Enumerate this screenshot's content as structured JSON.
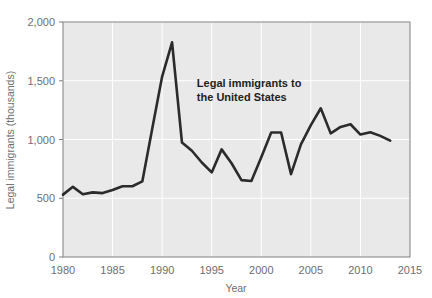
{
  "chart_data": {
    "type": "line",
    "title": "",
    "xlabel": "Year",
    "ylabel": "Legal immigrants (thousands)",
    "xlim": [
      1980,
      2015
    ],
    "ylim": [
      0,
      2000
    ],
    "grid": true,
    "legend": "none",
    "annotation": {
      "line1": "Legal immigrants to",
      "line2": "the United States",
      "x": 1993.5,
      "y": 1450
    },
    "xticks": [
      1980,
      1985,
      1990,
      1995,
      2000,
      2005,
      2010,
      2015
    ],
    "xtick_labels": [
      "1980",
      "1985",
      "1990",
      "1995",
      "2000",
      "2005",
      "2010",
      "2015"
    ],
    "yticks": [
      0,
      500,
      1000,
      1500,
      2000
    ],
    "ytick_labels": [
      "0",
      "500",
      "1,000",
      "1,500",
      "2,000"
    ],
    "series": [
      {
        "name": "Legal immigrants to the United States",
        "color": "#2b2b2b",
        "x": [
          1980,
          1981,
          1982,
          1983,
          1984,
          1985,
          1986,
          1987,
          1988,
          1989,
          1990,
          1991,
          1992,
          1993,
          1994,
          1995,
          1996,
          1997,
          1998,
          1999,
          2000,
          2001,
          2002,
          2003,
          2004,
          2005,
          2006,
          2007,
          2008,
          2009,
          2010,
          2011,
          2012,
          2013
        ],
        "values": [
          531,
          597,
          534,
          550,
          544,
          570,
          602,
          602,
          643,
          1091,
          1536,
          1827,
          974,
          904,
          804,
          720,
          916,
          798,
          654,
          647,
          850,
          1059,
          1060,
          705,
          958,
          1122,
          1266,
          1052,
          1107,
          1130,
          1042,
          1062,
          1031,
          990
        ]
      }
    ]
  },
  "colors": {
    "plot_background": "#e9e9e9",
    "grid": "#ffffff",
    "border": "#808083",
    "line": "#2b2b2b",
    "text_muted": "#6d6e70",
    "text_dark": "#231f20"
  }
}
